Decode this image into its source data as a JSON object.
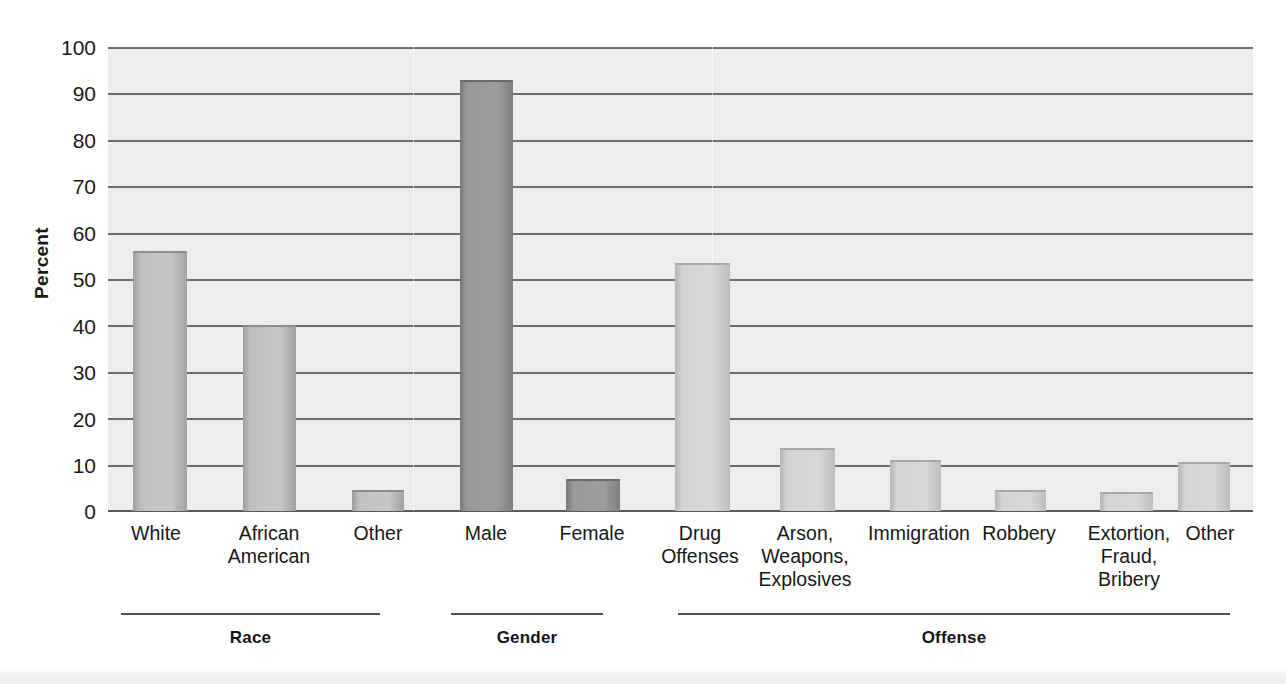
{
  "chart_data": {
    "type": "bar",
    "title": "",
    "xlabel": "",
    "ylabel": "Percent",
    "ylim": [
      0,
      100
    ],
    "yticks": [
      0,
      10,
      20,
      30,
      40,
      50,
      60,
      70,
      80,
      90,
      100
    ],
    "grid": true,
    "legend": "none",
    "groups": [
      {
        "name": "Race",
        "categories": [
          "White",
          "African American",
          "Other"
        ],
        "values": [
          56,
          40,
          4.5
        ]
      },
      {
        "name": "Gender",
        "categories": [
          "Male",
          "Female"
        ],
        "values": [
          93,
          7
        ]
      },
      {
        "name": "Offense",
        "categories": [
          "Drug Offenses",
          "Arson, Weapons, Explosives",
          "Immigration",
          "Robbery",
          "Extortion, Fraud, Bribery",
          "Other"
        ],
        "values": [
          53.5,
          13.5,
          11,
          4.5,
          4,
          10.5
        ]
      }
    ],
    "categories": [
      "White",
      "African American",
      "Other",
      "Male",
      "Female",
      "Drug Offenses",
      "Arson, Weapons, Explosives",
      "Immigration",
      "Robbery",
      "Extortion, Fraud, Bribery",
      "Other"
    ],
    "values": [
      56,
      40,
      4.5,
      93,
      7,
      53.5,
      13.5,
      11,
      4.5,
      4,
      10.5
    ]
  },
  "axis": {
    "y_label": "Percent",
    "ticks": [
      "100",
      "90",
      "80",
      "70",
      "60",
      "50",
      "40",
      "30",
      "20",
      "10",
      "0"
    ]
  },
  "bars": [
    {
      "id": "white",
      "label_line1": "White",
      "label_line2": "",
      "label_line3": "",
      "value": 56,
      "shade": "mid"
    },
    {
      "id": "african-american",
      "label_line1": "African",
      "label_line2": "American",
      "label_line3": "",
      "value": 40,
      "shade": "mid"
    },
    {
      "id": "race-other",
      "label_line1": "Other",
      "label_line2": "",
      "label_line3": "",
      "value": 4.5,
      "shade": "mid"
    },
    {
      "id": "male",
      "label_line1": "Male",
      "label_line2": "",
      "label_line3": "",
      "value": 93,
      "shade": "dark"
    },
    {
      "id": "female",
      "label_line1": "Female",
      "label_line2": "",
      "label_line3": "",
      "value": 7,
      "shade": "dark"
    },
    {
      "id": "drug-offenses",
      "label_line1": "Drug",
      "label_line2": "Offenses",
      "label_line3": "",
      "value": 53.5,
      "shade": "light"
    },
    {
      "id": "arson-weapons-explosives",
      "label_line1": "Arson,",
      "label_line2": "Weapons,",
      "label_line3": "Explosives",
      "value": 13.5,
      "shade": "light"
    },
    {
      "id": "immigration",
      "label_line1": "Immigration",
      "label_line2": "",
      "label_line3": "",
      "value": 11,
      "shade": "light"
    },
    {
      "id": "robbery",
      "label_line1": "Robbery",
      "label_line2": "",
      "label_line3": "",
      "value": 4.5,
      "shade": "light"
    },
    {
      "id": "extortion-fraud-bribery",
      "label_line1": "Extortion,",
      "label_line2": "Fraud,",
      "label_line3": "Bribery",
      "value": 4,
      "shade": "light"
    },
    {
      "id": "offense-other",
      "label_line1": "Other",
      "label_line2": "",
      "label_line3": "",
      "value": 10.5,
      "shade": "light"
    }
  ],
  "groups": [
    {
      "id": "race",
      "label": "Race"
    },
    {
      "id": "gender",
      "label": "Gender"
    },
    {
      "id": "offense",
      "label": "Offense"
    }
  ],
  "colors": {
    "plot_background": "#ededed",
    "gridline": "#6e6e6e",
    "bar_mid": "#c0c0c0",
    "bar_dark": "#9a9a9a",
    "bar_light": "#d6d6d6",
    "text": "#1a1a1a"
  }
}
